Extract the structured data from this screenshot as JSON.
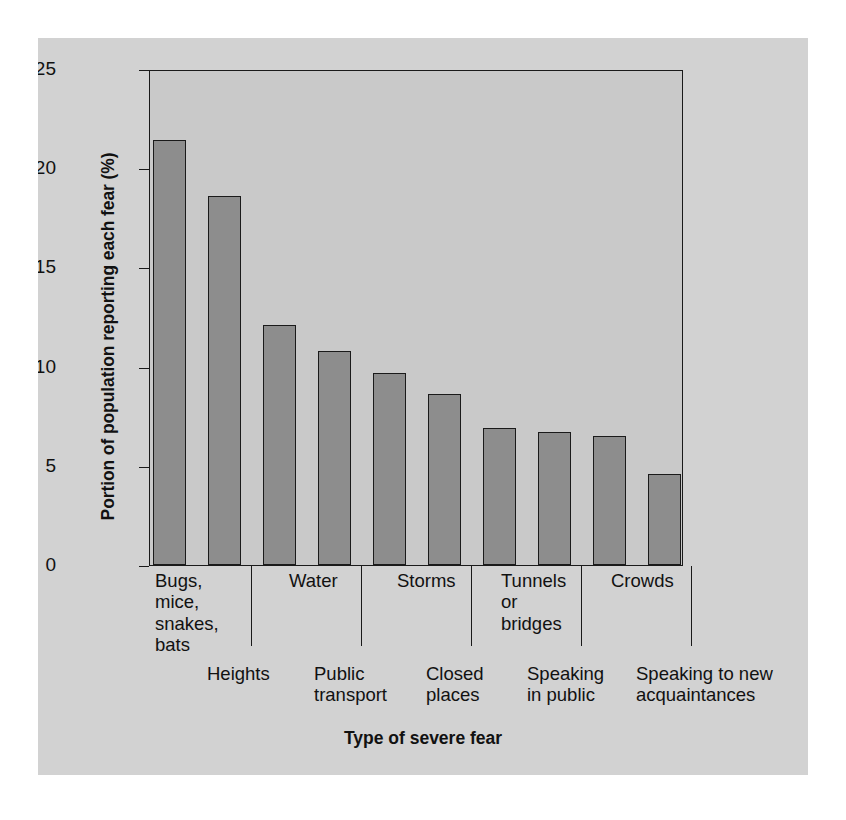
{
  "figure": {
    "background_color": "#d2d2d2",
    "plot_background_color": "#c9c9c9",
    "bar_color": "#8d8d8d",
    "axis_color": "#1a1a1a"
  },
  "chart_data": {
    "type": "bar",
    "title": "",
    "xlabel": "Type of severe fear",
    "ylabel": "Portion of population reporting each fear (%)",
    "ylim": [
      0,
      25
    ],
    "yticks": [
      0,
      5,
      10,
      15,
      20,
      25
    ],
    "ytick_labels": [
      "0",
      "5",
      "10",
      "15",
      "20",
      "25"
    ],
    "grid": false,
    "legend": false,
    "categories": [
      "Bugs,\nmice,\nsnakes,\nbats",
      "Heights",
      "Water",
      "Public\ntransport",
      "Storms",
      "Closed\nplaces",
      "Tunnels\nor\nbridges",
      "Speaking\nin public",
      "Crowds",
      "Speaking to new\nacquaintances"
    ],
    "values": [
      21.4,
      18.6,
      12.1,
      10.8,
      9.7,
      8.6,
      6.9,
      6.7,
      6.5,
      4.6
    ]
  }
}
